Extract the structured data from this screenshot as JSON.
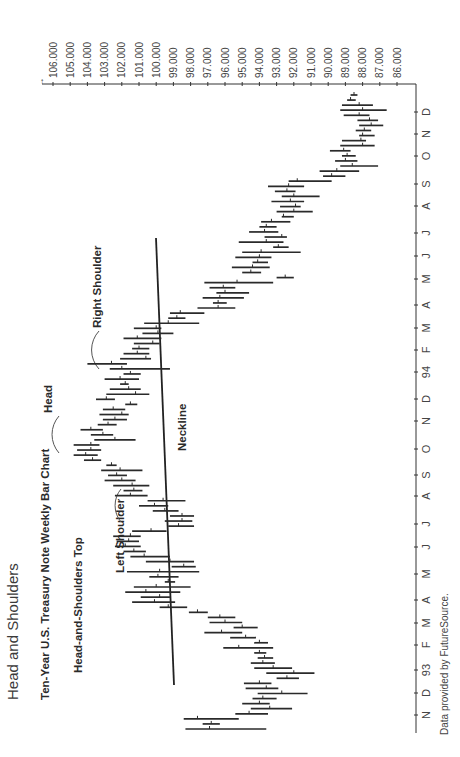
{
  "page": {
    "title": "Head and Shoulders",
    "chart_title": "Ten-Year U.S. Treasury Note Weekly Bar Chart",
    "pattern_label": "Head-and-Shoulders Top",
    "source": "Data provided by FutureSource."
  },
  "annotations": {
    "left_shoulder": "Left Shoulder",
    "head": "Head",
    "right_shoulder": "Right Shoulder",
    "neckline": "Neckline"
  },
  "chart_data": {
    "type": "bar",
    "subtype": "ohlc-weekly",
    "orientation": "rotated -90deg (time axis vertical, price axis horizontal)",
    "title": "Ten-Year U.S. Treasury Note Weekly Bar Chart",
    "subtitle": "Head-and-Shoulders Top",
    "xlabel": "",
    "ylabel": "",
    "ylim": [
      86,
      106
    ],
    "y_ticks": [
      "106.000",
      "105.000",
      "104.000",
      "103.000",
      "102.000",
      "101.000",
      "100.000",
      "99.000",
      "98.000",
      "97.000",
      "96.000",
      "95.000",
      "94.000",
      "93.000",
      "92.000",
      "91.000",
      "90.000",
      "89.000",
      "88.000",
      "87.000",
      "86.000"
    ],
    "x_ticks": [
      "N",
      "D",
      "93",
      "F",
      "M",
      "A",
      "M",
      "J",
      "J",
      "A",
      "S",
      "O",
      "N",
      "D",
      "94",
      "F",
      "M",
      "A",
      "M",
      "J",
      "J",
      "A",
      "S",
      "O",
      "N",
      "D"
    ],
    "grid": false,
    "legend": null,
    "neckline": {
      "start": {
        "date": "Jan 93",
        "price": 99.4
      },
      "end": {
        "date": "Apr 94",
        "price": 100.2
      }
    },
    "series": [
      {
        "name": "Weekly range (low, high, close)",
        "values": [
          [
            93.6,
            98.3,
            96.9
          ],
          [
            96.3,
            97.3,
            96.8
          ],
          [
            95.2,
            98.4,
            97.6
          ],
          [
            93.5,
            95.4,
            94.6
          ],
          [
            92.1,
            94.5,
            93.4
          ],
          [
            93.4,
            95.0,
            94.0
          ],
          [
            93.0,
            94.4,
            93.8
          ],
          [
            91.2,
            94.1,
            92.7
          ],
          [
            92.9,
            94.8,
            93.6
          ],
          [
            93.3,
            94.9,
            94.0
          ],
          [
            91.7,
            93.0,
            92.4
          ],
          [
            90.8,
            93.6,
            92.0
          ],
          [
            92.1,
            94.3,
            93.2
          ],
          [
            93.1,
            94.5,
            93.8
          ],
          [
            93.2,
            94.1,
            93.7
          ],
          [
            93.6,
            94.3,
            94.0
          ],
          [
            93.2,
            96.1,
            95.2
          ],
          [
            93.5,
            94.3,
            94.0
          ],
          [
            94.2,
            95.7,
            94.8
          ],
          [
            95.0,
            97.2,
            96.2
          ],
          [
            94.1,
            95.5,
            95.0
          ],
          [
            95.0,
            96.9,
            96.0
          ],
          [
            95.4,
            97.0,
            96.3
          ],
          [
            97.0,
            98.1,
            97.6
          ],
          [
            98.2,
            99.8,
            99.3
          ],
          [
            98.9,
            101.4,
            100.1
          ],
          [
            99.2,
            100.9,
            99.8
          ],
          [
            98.6,
            101.8,
            100.6
          ],
          [
            98.0,
            101.3,
            100.0
          ],
          [
            98.9,
            99.5,
            99.3
          ],
          [
            98.7,
            100.4,
            99.9
          ],
          [
            97.5,
            101.7,
            99.8
          ],
          [
            97.7,
            99.1,
            98.4
          ],
          [
            97.8,
            100.6,
            99.2
          ],
          [
            99.2,
            101.5,
            100.7
          ],
          [
            100.6,
            101.9,
            101.3
          ],
          [
            100.9,
            102.4,
            101.8
          ],
          [
            101.0,
            102.3,
            101.6
          ],
          [
            100.9,
            102.5,
            101.5
          ],
          [
            99.4,
            101.4,
            100.3
          ],
          [
            97.8,
            99.3,
            98.7
          ],
          [
            97.9,
            99.5,
            98.5
          ],
          [
            97.8,
            99.2,
            98.5
          ],
          [
            98.7,
            100.2,
            99.5
          ],
          [
            99.3,
            101.0,
            100.1
          ],
          [
            98.3,
            100.5,
            99.6
          ],
          [
            100.5,
            102.4,
            101.5
          ],
          [
            100.8,
            101.9,
            101.3
          ],
          [
            100.4,
            102.5,
            101.4
          ],
          [
            101.2,
            103.0,
            102.0
          ],
          [
            101.7,
            102.8,
            102.3
          ],
          [
            100.8,
            103.2,
            102.1
          ],
          [
            102.3,
            102.9,
            102.6
          ],
          [
            103.2,
            104.2,
            103.7
          ],
          [
            103.4,
            104.8,
            104.1
          ],
          [
            103.2,
            104.6,
            103.8
          ],
          [
            103.3,
            104.8,
            103.8
          ],
          [
            101.2,
            103.6,
            102.4
          ],
          [
            102.5,
            103.8,
            103.1
          ],
          [
            103.1,
            104.4,
            103.8
          ],
          [
            102.3,
            103.4,
            102.8
          ],
          [
            101.7,
            103.1,
            102.4
          ],
          [
            101.6,
            103.3,
            102.0
          ],
          [
            101.8,
            103.1,
            102.5
          ],
          [
            101.1,
            101.8,
            101.5
          ],
          [
            102.4,
            103.5,
            102.9
          ],
          [
            100.4,
            102.9,
            101.2
          ],
          [
            100.9,
            102.7,
            101.6
          ],
          [
            101.6,
            102.1,
            101.8
          ],
          [
            101.0,
            103.0,
            102.1
          ],
          [
            100.9,
            101.9,
            101.5
          ],
          [
            99.2,
            102.7,
            102.0
          ],
          [
            101.7,
            104.0,
            102.6
          ],
          [
            100.3,
            102.1,
            100.6
          ],
          [
            100.4,
            101.9,
            101.1
          ],
          [
            100.4,
            101.4,
            101.0
          ],
          [
            99.8,
            101.3,
            100.2
          ],
          [
            99.7,
            101.9,
            101.1
          ],
          [
            99.0,
            100.8,
            99.9
          ],
          [
            99.7,
            101.3,
            100.0
          ],
          [
            97.5,
            100.7,
            99.3
          ],
          [
            98.3,
            99.3,
            98.8
          ],
          [
            97.2,
            99.2,
            98.6
          ],
          [
            95.4,
            97.6,
            96.4
          ],
          [
            95.9,
            96.7,
            96.4
          ],
          [
            94.9,
            97.3,
            96.3
          ],
          [
            94.6,
            96.5,
            96.0
          ],
          [
            95.4,
            96.9,
            96.1
          ],
          [
            93.2,
            97.2,
            95.3
          ],
          [
            92.0,
            93.0,
            92.5
          ],
          [
            93.9,
            95.0,
            94.5
          ],
          [
            93.4,
            95.6,
            94.4
          ],
          [
            93.5,
            94.4,
            94.1
          ],
          [
            93.3,
            95.4,
            94.0
          ],
          [
            91.6,
            95.0,
            93.9
          ],
          [
            92.3,
            93.2,
            92.9
          ],
          [
            92.6,
            95.2,
            93.6
          ],
          [
            92.4,
            93.7,
            92.7
          ],
          [
            92.9,
            94.6,
            93.7
          ],
          [
            93.0,
            94.0,
            93.6
          ],
          [
            92.2,
            93.9,
            93.3
          ],
          [
            92.0,
            92.7,
            92.6
          ],
          [
            90.9,
            93.0,
            92.0
          ],
          [
            91.6,
            92.8,
            91.9
          ],
          [
            91.4,
            93.3,
            92.2
          ],
          [
            90.5,
            92.7,
            92.0
          ],
          [
            91.9,
            93.1,
            92.4
          ],
          [
            91.4,
            93.5,
            92.3
          ],
          [
            89.8,
            92.3,
            91.8
          ],
          [
            89.0,
            90.3,
            89.8
          ],
          [
            88.2,
            90.5,
            89.5
          ],
          [
            87.1,
            89.3,
            88.6
          ],
          [
            88.3,
            89.6,
            89.0
          ],
          [
            88.4,
            89.2,
            88.9
          ],
          [
            88.7,
            89.9,
            89.1
          ],
          [
            87.3,
            89.3,
            88.0
          ],
          [
            87.8,
            89.2,
            88.1
          ],
          [
            87.3,
            88.2,
            88.0
          ],
          [
            87.5,
            88.4,
            87.9
          ],
          [
            86.8,
            88.2,
            87.5
          ],
          [
            87.1,
            88.3,
            87.6
          ],
          [
            87.6,
            89.1,
            88.2
          ],
          [
            86.6,
            89.3,
            88.0
          ],
          [
            87.4,
            89.2,
            88.2
          ],
          [
            88.4,
            88.9,
            88.7
          ],
          [
            88.3,
            88.7,
            88.5
          ]
        ]
      }
    ]
  }
}
